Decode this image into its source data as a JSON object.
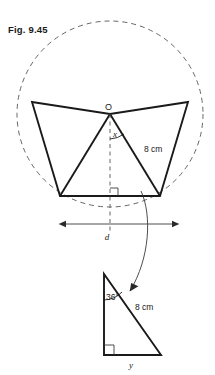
{
  "figure": {
    "label": "Fig. 9.45",
    "main_diagram": {
      "name": "regular-pentagon-inscribed-in-circle",
      "center_label": "O",
      "center_angle_label": "x",
      "radius_label": "8 cm",
      "diameter_label": "d",
      "right_angle_marker": true,
      "circle_style": "dashed",
      "polygon_sides": 5
    },
    "detail_triangle": {
      "name": "right-triangle-detail",
      "angle_label": "36°",
      "hypotenuse_label": "8 cm",
      "base_label": "y",
      "right_angle_marker": true
    },
    "colors": {
      "ink": "#1a1a1a",
      "dash": "#555555",
      "thin": "#3a3a3a",
      "background": "#ffffff"
    }
  }
}
